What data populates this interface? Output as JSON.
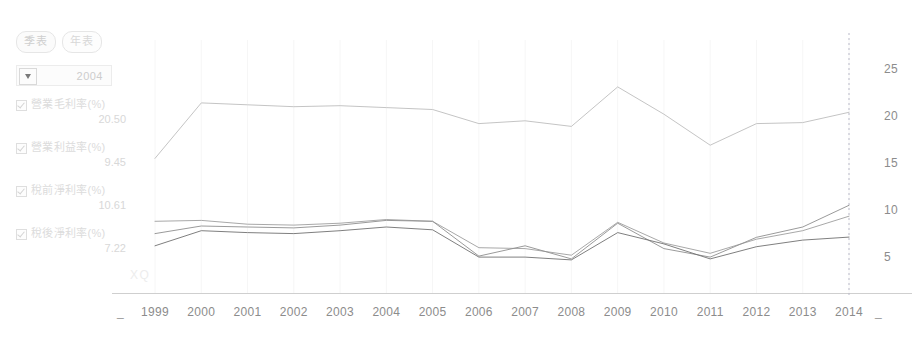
{
  "toolbar": {
    "tabs": [
      {
        "label": "季表",
        "selected": true
      },
      {
        "label": "年表",
        "selected": false
      }
    ]
  },
  "year_select": {
    "value": "2004",
    "caret_icon": "chevron-down-icon"
  },
  "legend": [
    {
      "label": "營業毛利率(%)",
      "value": "20.50",
      "checked": true,
      "color": "#b9b9b9"
    },
    {
      "label": "營業利益率(%)",
      "value": "9.45",
      "checked": true,
      "color": "#9a9a9a"
    },
    {
      "label": "稅前淨利率(%)",
      "value": "10.61",
      "checked": true,
      "color": "#8a8a8a"
    },
    {
      "label": "稅後淨利率(%)",
      "value": "7.22",
      "checked": true,
      "color": "#6e6e6e"
    }
  ],
  "watermark": "XQ",
  "chart_data": {
    "type": "line",
    "title": "",
    "xlabel": "",
    "ylabel": "",
    "grid": true,
    "legend_position": "left",
    "ylim": [
      0,
      27.5
    ],
    "yticks": [
      5,
      10,
      15,
      20,
      25
    ],
    "categories": [
      "1999",
      "2000",
      "2001",
      "2002",
      "2003",
      "2004",
      "2005",
      "2006",
      "2007",
      "2008",
      "2009",
      "2010",
      "2011",
      "2012",
      "2013",
      "2014"
    ],
    "edge_tick_marks": [
      "_",
      "_"
    ],
    "series": [
      {
        "name": "營業毛利率(%)",
        "color": "#bdbdbd",
        "values": [
          15.6,
          21.5,
          21.3,
          21.1,
          21.2,
          21.0,
          20.8,
          19.3,
          19.6,
          19.0,
          23.2,
          20.3,
          17.0,
          19.3,
          19.4,
          20.5
        ]
      },
      {
        "name": "營業利益率(%)",
        "color": "#9e9e9e",
        "values": [
          8.9,
          9.0,
          8.6,
          8.5,
          8.7,
          9.1,
          8.9,
          6.1,
          6.0,
          5.3,
          8.8,
          6.6,
          5.5,
          7.0,
          7.9,
          9.45
        ]
      },
      {
        "name": "稅前淨利率(%)",
        "color": "#8f8f8f",
        "values": [
          7.6,
          8.4,
          8.3,
          8.2,
          8.5,
          9.0,
          8.9,
          5.2,
          6.3,
          4.9,
          8.7,
          6.0,
          5.1,
          7.2,
          8.3,
          10.61
        ]
      },
      {
        "name": "稅後淨利率(%)",
        "color": "#707070",
        "values": [
          6.3,
          7.9,
          7.7,
          7.6,
          7.9,
          8.3,
          8.0,
          5.1,
          5.1,
          4.8,
          7.7,
          6.5,
          4.9,
          6.2,
          6.9,
          7.22
        ]
      }
    ],
    "marker_line_x": "2014"
  }
}
